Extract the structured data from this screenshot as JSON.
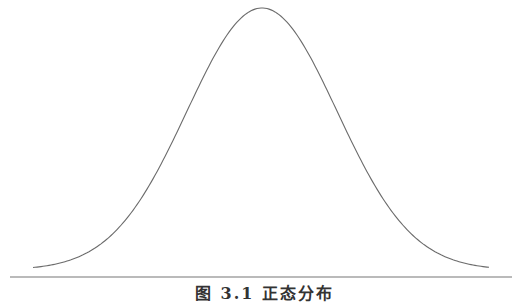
{
  "chart_data": {
    "type": "line",
    "title": "",
    "caption": "图 3.1  正态分布",
    "xlabel": "",
    "ylabel": "",
    "series": [
      {
        "name": "normal-density",
        "x": [
          -3,
          -2.5,
          -2,
          -1.5,
          -1,
          -0.5,
          0,
          0.5,
          1,
          1.5,
          2,
          2.5,
          3
        ],
        "values": [
          0.004,
          0.018,
          0.054,
          0.13,
          0.242,
          0.352,
          0.399,
          0.352,
          0.242,
          0.13,
          0.054,
          0.018,
          0.004
        ]
      }
    ],
    "grid": false,
    "legend": false
  },
  "colors": {
    "curve": "#6b6b6b",
    "baseline": "#777777",
    "background": "#ffffff"
  }
}
